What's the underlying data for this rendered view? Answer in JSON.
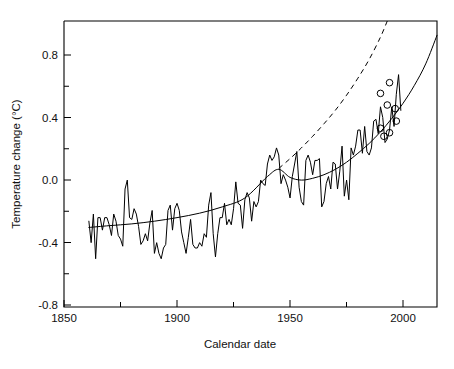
{
  "chart_data": {
    "type": "line",
    "title": "",
    "xlabel": "Calendar date",
    "ylabel": "Temperature change (°C)",
    "xlim": [
      1850,
      2015
    ],
    "ylim": [
      -0.8,
      0.8
    ],
    "grid": false,
    "legend": "none",
    "x_ticks_major": [
      1850,
      1900,
      1950,
      2000
    ],
    "x_tick_labels": [
      "1850",
      "1900",
      "1950",
      "2000"
    ],
    "x_ticks_minor": [
      1875,
      1925,
      1975
    ],
    "y_ticks_major": [
      -0.8,
      -0.4,
      0.0,
      0.4,
      0.8
    ],
    "y_tick_labels": [
      "-0.8",
      "-0.4",
      "0.0",
      "0.4",
      "0.8"
    ],
    "y_ticks_minor": [
      -0.6,
      -0.2,
      0.2,
      0.6
    ],
    "series": [
      {
        "name": "observed-annual-temperature-anomaly",
        "style": "solid-jagged",
        "x": [
          1861,
          1862,
          1863,
          1864,
          1865,
          1866,
          1867,
          1868,
          1869,
          1870,
          1871,
          1872,
          1873,
          1874,
          1875,
          1876,
          1877,
          1878,
          1879,
          1880,
          1881,
          1882,
          1883,
          1884,
          1885,
          1886,
          1887,
          1888,
          1889,
          1890,
          1891,
          1892,
          1893,
          1894,
          1895,
          1896,
          1897,
          1898,
          1899,
          1900,
          1901,
          1902,
          1903,
          1904,
          1905,
          1906,
          1907,
          1908,
          1909,
          1910,
          1911,
          1912,
          1913,
          1914,
          1915,
          1916,
          1917,
          1918,
          1919,
          1920,
          1921,
          1922,
          1923,
          1924,
          1925,
          1926,
          1927,
          1928,
          1929,
          1930,
          1931,
          1932,
          1933,
          1934,
          1935,
          1936,
          1937,
          1938,
          1939,
          1940,
          1941,
          1942,
          1943,
          1944,
          1945,
          1946,
          1947,
          1948,
          1949,
          1950,
          1951,
          1952,
          1953,
          1954,
          1955,
          1956,
          1957,
          1958,
          1959,
          1960,
          1961,
          1962,
          1963,
          1964,
          1965,
          1966,
          1967,
          1968,
          1969,
          1970,
          1971,
          1972,
          1973,
          1974,
          1975,
          1976,
          1977,
          1978,
          1979,
          1980,
          1981,
          1982,
          1983,
          1984,
          1985,
          1986,
          1987,
          1988,
          1989,
          1990,
          1991,
          1992,
          1993,
          1994,
          1995,
          1996,
          1997,
          1998,
          1999
        ],
        "y": [
          -0.32,
          -0.44,
          -0.28,
          -0.53,
          -0.3,
          -0.3,
          -0.37,
          -0.3,
          -0.3,
          -0.34,
          -0.4,
          -0.28,
          -0.32,
          -0.4,
          -0.42,
          -0.46,
          -0.14,
          -0.09,
          -0.3,
          -0.31,
          -0.25,
          -0.28,
          -0.35,
          -0.45,
          -0.43,
          -0.39,
          -0.43,
          -0.33,
          -0.26,
          -0.5,
          -0.44,
          -0.5,
          -0.53,
          -0.47,
          -0.45,
          -0.26,
          -0.23,
          -0.37,
          -0.25,
          -0.22,
          -0.26,
          -0.38,
          -0.44,
          -0.5,
          -0.41,
          -0.31,
          -0.45,
          -0.47,
          -0.47,
          -0.44,
          -0.46,
          -0.39,
          -0.41,
          -0.23,
          -0.16,
          -0.39,
          -0.52,
          -0.39,
          -0.3,
          -0.3,
          -0.22,
          -0.34,
          -0.31,
          -0.34,
          -0.25,
          -0.1,
          -0.22,
          -0.23,
          -0.36,
          -0.2,
          -0.16,
          -0.19,
          -0.32,
          -0.21,
          -0.24,
          -0.21,
          -0.09,
          -0.11,
          -0.12,
          0.0,
          0.05,
          0.02,
          0.04,
          0.09,
          0.05,
          -0.11,
          -0.06,
          -0.09,
          -0.13,
          -0.19,
          -0.07,
          0.0,
          0.07,
          -0.13,
          -0.21,
          -0.23,
          0.02,
          0.05,
          0.01,
          -0.06,
          0.02,
          0.02,
          0.03,
          -0.24,
          -0.21,
          -0.11,
          -0.07,
          -0.14,
          0.01,
          0.0,
          -0.14,
          -0.04,
          0.1,
          -0.18,
          -0.09,
          -0.2,
          0.09,
          0.05,
          0.1,
          0.19,
          0.19,
          0.06,
          0.21,
          0.07,
          0.05,
          0.09,
          0.24,
          0.25,
          0.17,
          0.32,
          0.26,
          0.12,
          0.14,
          0.19,
          0.32,
          0.21,
          0.39,
          0.5,
          0.3
        ]
      },
      {
        "name": "fitted-model-historical",
        "style": "solid-smooth",
        "x": [
          1861,
          1870,
          1880,
          1890,
          1900,
          1910,
          1920,
          1930,
          1940,
          1945,
          1950,
          1955,
          1960,
          1965,
          1970,
          1975,
          1980,
          1985,
          1990,
          1995,
          2000,
          2005,
          2010,
          2015
        ],
        "y": [
          -0.355,
          -0.345,
          -0.335,
          -0.32,
          -0.3,
          -0.275,
          -0.24,
          -0.19,
          -0.07,
          -0.03,
          -0.075,
          -0.09,
          -0.08,
          -0.06,
          -0.03,
          0.01,
          0.06,
          0.115,
          0.18,
          0.255,
          0.34,
          0.44,
          0.56,
          0.72
        ]
      },
      {
        "name": "projected-model-dashed",
        "style": "dashed",
        "x": [
          1945,
          1950,
          1955,
          1960,
          1965,
          1970,
          1975,
          1980,
          1985,
          1990,
          1993
        ],
        "y": [
          -0.025,
          0.03,
          0.09,
          0.155,
          0.225,
          0.3,
          0.385,
          0.48,
          0.585,
          0.71,
          0.8
        ]
      }
    ],
    "markers": {
      "name": "observation-circles",
      "shape": "open-circle",
      "points": [
        {
          "x": 1990.0,
          "y": 0.395
        },
        {
          "x": 1994.0,
          "y": 0.455
        },
        {
          "x": 1993.0,
          "y": 0.33
        },
        {
          "x": 1996.5,
          "y": 0.31
        },
        {
          "x": 1997.0,
          "y": 0.24
        },
        {
          "x": 1990.0,
          "y": 0.2
        },
        {
          "x": 1994.0,
          "y": 0.175
        },
        {
          "x": 1991.5,
          "y": 0.155
        }
      ]
    }
  }
}
